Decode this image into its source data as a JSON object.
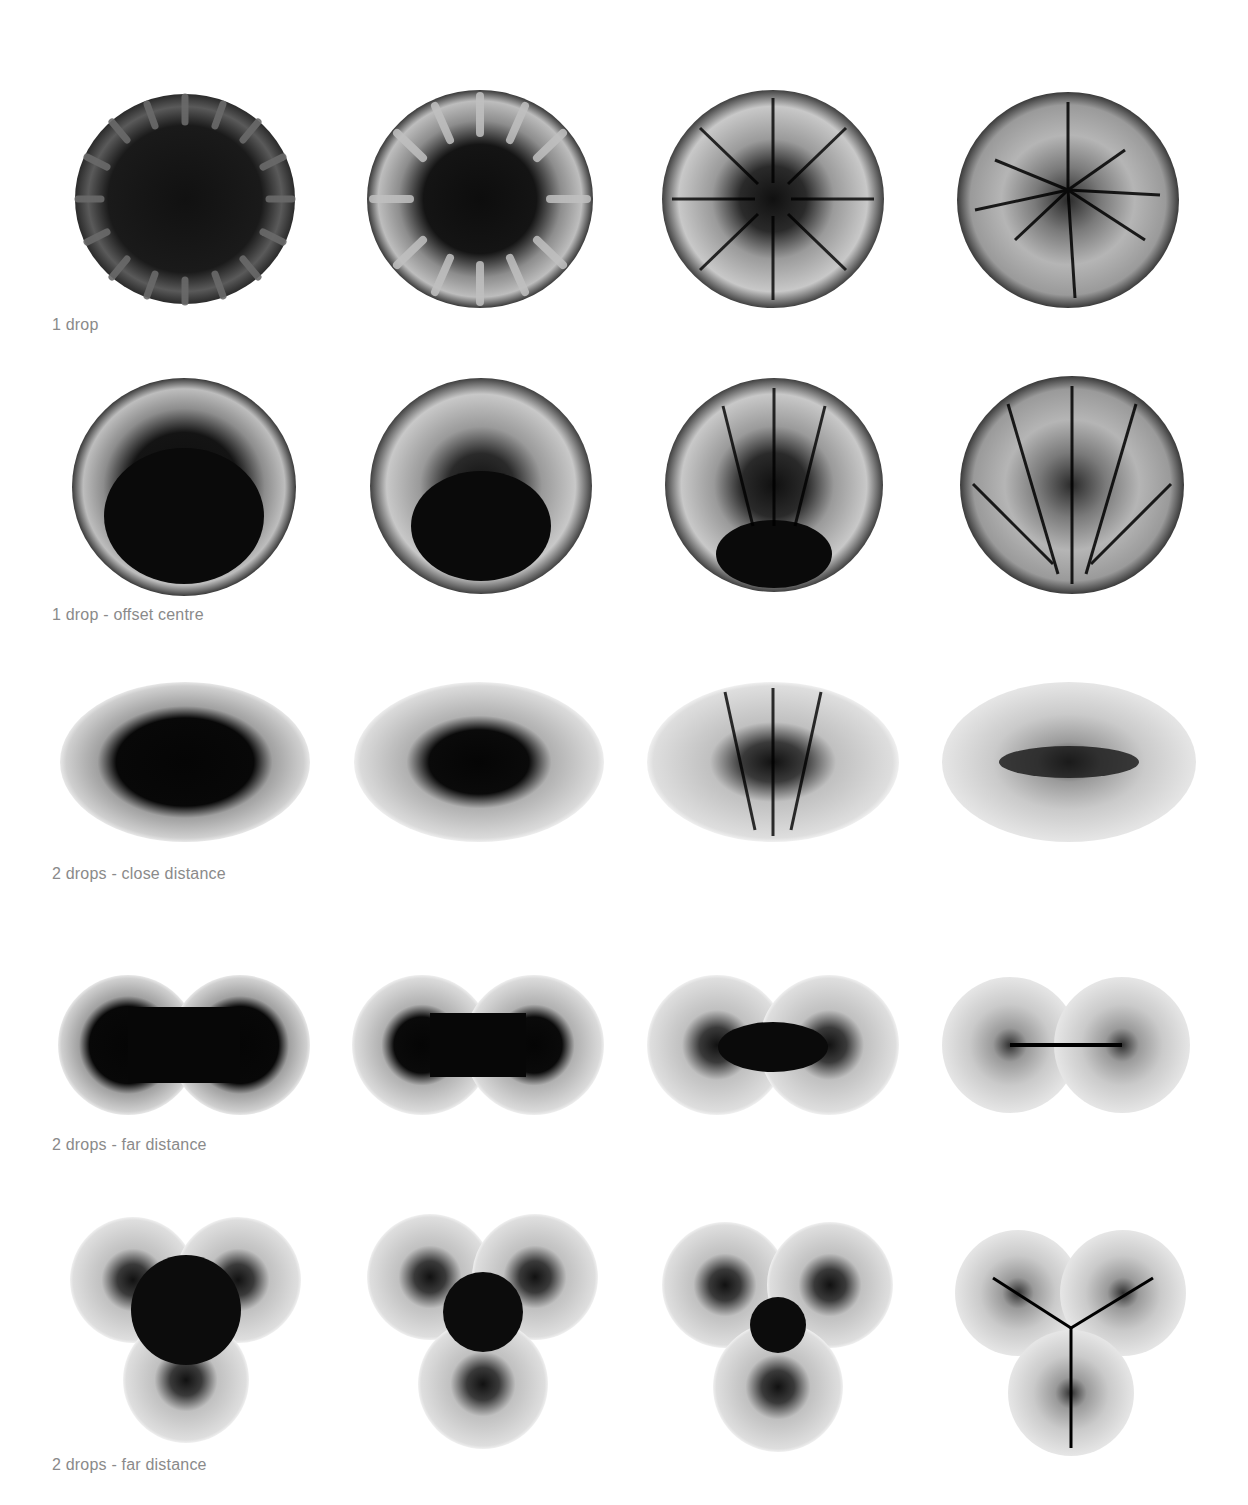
{
  "figure": {
    "rows": [
      {
        "caption": "1 drop",
        "shape": "circle",
        "stages": [
          "stage-1",
          "stage-2",
          "stage-3",
          "stage-4"
        ]
      },
      {
        "caption": "1 drop - offset centre",
        "shape": "circle",
        "stages": [
          "stage-1",
          "stage-2",
          "stage-3",
          "stage-4"
        ]
      },
      {
        "caption": "2 drops - close distance",
        "shape": "ellipse",
        "stages": [
          "stage-1",
          "stage-2",
          "stage-3",
          "stage-4"
        ]
      },
      {
        "caption": "2 drops - far distance",
        "shape": "double-lobe",
        "stages": [
          "stage-1",
          "stage-2",
          "stage-3",
          "stage-4"
        ]
      },
      {
        "caption": "2 drops - far distance",
        "shape": "triple-lobe",
        "stages": [
          "stage-1",
          "stage-2",
          "stage-3",
          "stage-4"
        ]
      }
    ],
    "colors": {
      "background": "#ffffff",
      "caption": "#8a8a8a",
      "specimen_dark": "#0c0c0c",
      "specimen_light": "#d8d8d8"
    }
  }
}
